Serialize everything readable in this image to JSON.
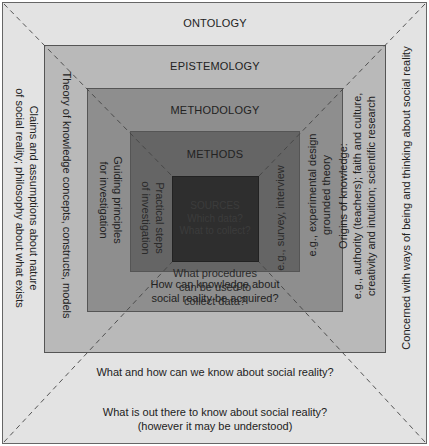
{
  "layers": {
    "ontology": {
      "title": "ONTOLOGY",
      "left_text_line1": "Claims and assumptions about nature",
      "left_text_line2": "of social reality; philosophy about what exists",
      "right_text": "Concerned with ways of being and thinking about social reality",
      "bottom_line1": "What is out there to know about social reality?",
      "bottom_line2": "(however it may be understood)",
      "color": "#e3e3e3"
    },
    "epistemology": {
      "title": "EPISTEMOLOGY",
      "left_text": "Theory of knowledge concepts, constructs, models",
      "right_line1": "Origins of knowledge:",
      "right_line2": "e.g., authority (teachers); faith and culture,",
      "right_line3": "creativity and intuition; scientific research",
      "bottom_text": "What and how can we know about social reality?",
      "color": "#b9b9b9"
    },
    "methodology": {
      "title": "METHODOLOGY",
      "left_line1": "Guiding principles",
      "left_line2": "for investigation",
      "right_line1": "e.g., experimental design",
      "right_line2": "grounded theory",
      "bottom_line1": "How can knowledge about",
      "bottom_line2": "social reality be acquired?",
      "color": "#8e8e8e"
    },
    "methods": {
      "title": "METHODS",
      "left_line1": "Practical steps",
      "left_line2": "of investigation",
      "right_text": "e.g., survey, interview",
      "bottom_line1": "What procedures",
      "bottom_line2": "can be used to",
      "bottom_line3": "collect data?",
      "color": "#656565"
    },
    "sources": {
      "title": "SOURCES",
      "line1": "Which data?",
      "line2": "What to collect?",
      "color": "#2e2e2e"
    }
  }
}
